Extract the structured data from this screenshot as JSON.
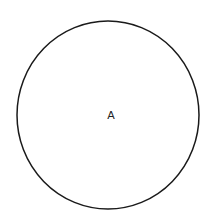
{
  "diagram": {
    "shapes": [
      {
        "type": "circle",
        "label": "A",
        "cx": 108,
        "cy": 115,
        "rx": 91,
        "ry": 94,
        "stroke": "#1a1a1a",
        "fill": "#ffffff"
      }
    ]
  }
}
